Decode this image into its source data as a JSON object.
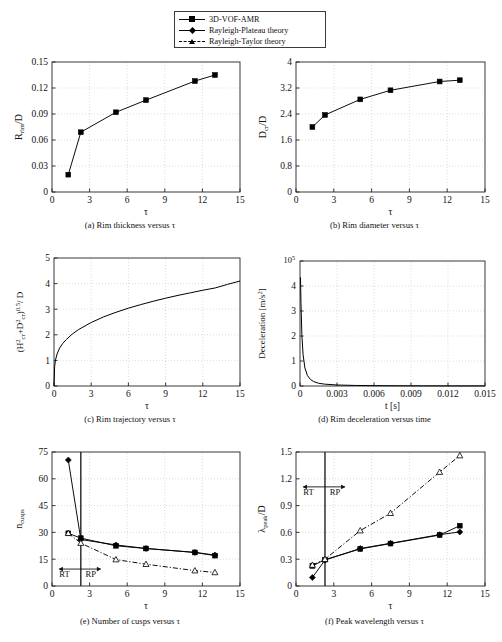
{
  "legend": {
    "entries": [
      {
        "label": "3D-VOF-AMR",
        "marker": "square-marker",
        "line": "solid",
        "color": "#000000"
      },
      {
        "label": "Rayleigh-Plateau theory",
        "marker": "diamond-marker",
        "line": "solid",
        "color": "#000000"
      },
      {
        "label": "Rayleigh-Taylor theory",
        "marker": "triangle-marker",
        "line": "dash-dot",
        "color": "#000000"
      }
    ]
  },
  "captions": {
    "a": "(a) Rim thickness versus τ",
    "b": "(b) Rim diameter versus τ",
    "c": "(c) Rim trajectory versus τ",
    "d": "(d) Rim deceleration versus time",
    "e": "(e) Number of cusps versus τ",
    "f": "(f) Peak wavelength versus τ"
  },
  "chart_data": [
    {
      "id": "a",
      "type": "line",
      "title": "Rim thickness versus τ",
      "xlabel": "τ",
      "ylabel": "R_rim /D",
      "xlim": [
        0,
        15
      ],
      "ylim": [
        0,
        0.15
      ],
      "xticks": [
        0,
        3,
        6,
        9,
        12,
        15
      ],
      "yticks": [
        0,
        0.03,
        0.06,
        0.09,
        0.12,
        0.15
      ],
      "xticklabels": [
        "0",
        "3",
        "6",
        "9",
        "12",
        "15"
      ],
      "yticklabels": [
        "0",
        "0.03",
        "0.06",
        "0.09",
        "0.12",
        "0.15"
      ],
      "grid": true,
      "legend_position": "external-top",
      "series": [
        {
          "name": "3D-VOF-AMR",
          "marker": "square",
          "line": "solid",
          "x": [
            1.3,
            2.3,
            5.1,
            7.5,
            11.4,
            13.0
          ],
          "values": [
            0.02,
            0.069,
            0.092,
            0.106,
            0.128,
            0.135
          ]
        }
      ]
    },
    {
      "id": "b",
      "type": "line",
      "title": "Rim diameter versus τ",
      "xlabel": "τ",
      "ylabel": "D_cr /D",
      "xlim": [
        0,
        15
      ],
      "ylim": [
        0,
        4
      ],
      "xticks": [
        0,
        3,
        6,
        9,
        12,
        15
      ],
      "yticks": [
        0,
        0.8,
        1.6,
        2.4,
        3.2,
        4
      ],
      "xticklabels": [
        "0",
        "3",
        "6",
        "9",
        "12",
        "15"
      ],
      "yticklabels": [
        "0",
        "0.8",
        "1.6",
        "2.4",
        "3.2",
        "4"
      ],
      "grid": true,
      "series": [
        {
          "name": "3D-VOF-AMR",
          "marker": "square",
          "line": "solid",
          "x": [
            1.3,
            2.3,
            5.1,
            7.5,
            11.4,
            13.0
          ],
          "values": [
            2.0,
            2.37,
            2.85,
            3.13,
            3.4,
            3.44
          ]
        }
      ]
    },
    {
      "id": "c",
      "type": "line",
      "title": "Rim trajectory versus τ",
      "xlabel": "τ",
      "ylabel": "(H²_cr+D²_cr)^0.5 / D",
      "xlim": [
        0,
        15
      ],
      "ylim": [
        0,
        5
      ],
      "xticks": [
        0,
        3,
        6,
        9,
        12,
        15
      ],
      "yticks": [
        0,
        1,
        2,
        3,
        4,
        5
      ],
      "xticklabels": [
        "0",
        "3",
        "6",
        "9",
        "12",
        "15"
      ],
      "yticklabels": [
        "0",
        "1",
        "2",
        "3",
        "4",
        "5"
      ],
      "grid": true,
      "series": [
        {
          "name": "rim-trajectory-curve",
          "marker": "none",
          "line": "solid",
          "x": [
            0.0,
            0.05,
            0.12,
            0.25,
            0.45,
            0.7,
            1.0,
            1.5,
            2.0,
            3.0,
            4.0,
            5.0,
            6.0,
            7.0,
            8.0,
            9.0,
            10.0,
            11.0,
            12.0,
            13.0,
            14.0,
            15.0
          ],
          "values": [
            0.0,
            0.75,
            1.02,
            1.25,
            1.48,
            1.66,
            1.82,
            2.04,
            2.21,
            2.48,
            2.7,
            2.88,
            3.04,
            3.18,
            3.31,
            3.43,
            3.54,
            3.64,
            3.74,
            3.83,
            3.97,
            4.1
          ]
        }
      ]
    },
    {
      "id": "d",
      "type": "line",
      "title": "Rim deceleration versus time",
      "xlabel": "t [s]",
      "ylabel": "Deceleration [m/s²]",
      "y_exponent": "10⁵",
      "xlim": [
        0,
        0.015
      ],
      "ylim": [
        0,
        5
      ],
      "xticks": [
        0,
        0.003,
        0.006,
        0.009,
        0.012,
        0.015
      ],
      "yticks": [
        0,
        1,
        2,
        3,
        4,
        5
      ],
      "xticklabels": [
        "0",
        "0.003",
        "0.006",
        "0.009",
        "0.012",
        "0.015"
      ],
      "yticklabels": [
        "0",
        "1",
        "2",
        "3",
        "4",
        ""
      ],
      "grid": true,
      "series": [
        {
          "name": "deceleration-curve",
          "marker": "none",
          "line": "solid",
          "x": [
            4e-05,
            8e-05,
            0.00015,
            0.00025,
            0.0004,
            0.0006,
            0.00085,
            0.0011,
            0.0015,
            0.002,
            0.003,
            0.0045,
            0.006,
            0.008,
            0.01,
            0.0125,
            0.015
          ],
          "values": [
            4.35,
            3.3,
            2.05,
            1.25,
            0.72,
            0.42,
            0.26,
            0.18,
            0.11,
            0.075,
            0.04,
            0.022,
            0.014,
            0.009,
            0.006,
            0.004,
            0.003
          ]
        }
      ]
    },
    {
      "id": "e",
      "type": "line",
      "title": "Number of cusps versus τ",
      "xlabel": "τ",
      "ylabel": "n_cusps",
      "xlim": [
        0,
        15
      ],
      "ylim": [
        0,
        75
      ],
      "xticks": [
        0,
        3,
        6,
        9,
        12,
        15
      ],
      "yticks": [
        0,
        15,
        30,
        45,
        60,
        75
      ],
      "xticklabels": [
        "0",
        "3",
        "6",
        "9",
        "12",
        "15"
      ],
      "yticklabels": [
        "0",
        "15",
        "30",
        "45",
        "60",
        "75"
      ],
      "grid": true,
      "regime_divider_x": 2.3,
      "annotations": [
        {
          "text": "RT",
          "x": 1.0,
          "y": 5.0
        },
        {
          "text": "RP",
          "x": 3.1,
          "y": 5.0
        }
      ],
      "series": [
        {
          "name": "3D-VOF-AMR",
          "marker": "square",
          "line": "solid",
          "x": [
            1.3,
            2.3,
            5.1,
            7.5,
            11.4,
            13.0
          ],
          "values": [
            29.5,
            26.8,
            22.5,
            21.0,
            18.8,
            17.0
          ]
        },
        {
          "name": "Rayleigh-Plateau theory",
          "marker": "diamond",
          "line": "solid",
          "x": [
            1.3,
            2.3,
            5.1,
            7.5,
            11.4,
            13.0
          ],
          "values": [
            70.5,
            26.0,
            23.0,
            21.0,
            18.8,
            17.3
          ]
        },
        {
          "name": "Rayleigh-Taylor theory",
          "marker": "triangle",
          "line": "dash-dot",
          "x": [
            1.3,
            2.3,
            5.1,
            7.5,
            11.4,
            13.0
          ],
          "values": [
            29.5,
            24.0,
            14.8,
            12.2,
            8.6,
            7.6
          ]
        }
      ]
    },
    {
      "id": "f",
      "type": "line",
      "title": "Peak wavelength versus τ",
      "xlabel": "τ",
      "ylabel": "λ_peak /D",
      "xlim": [
        0,
        15
      ],
      "ylim": [
        0,
        1.5
      ],
      "xticks": [
        0,
        3,
        6,
        9,
        12,
        15
      ],
      "yticks": [
        0,
        0.3,
        0.6,
        0.9,
        1.2,
        1.5
      ],
      "xticklabels": [
        "0",
        "3",
        "6",
        "9",
        "12",
        "15"
      ],
      "yticklabels": [
        "0",
        "0.3",
        "0.6",
        "0.9",
        "1.2",
        "1.5"
      ],
      "grid": true,
      "regime_divider_x": 2.3,
      "annotations": [
        {
          "text": "RT",
          "x": 1.0,
          "y": 1.02
        },
        {
          "text": "RP",
          "x": 3.1,
          "y": 1.02
        }
      ],
      "series": [
        {
          "name": "3D-VOF-AMR",
          "marker": "square",
          "line": "solid",
          "x": [
            1.3,
            2.3,
            5.1,
            7.5,
            11.4,
            13.0
          ],
          "values": [
            0.225,
            0.295,
            0.415,
            0.475,
            0.57,
            0.675
          ]
        },
        {
          "name": "Rayleigh-Plateau theory",
          "marker": "diamond",
          "line": "solid",
          "x": [
            1.3,
            2.3,
            5.1,
            7.5,
            11.4,
            13.0
          ],
          "values": [
            0.095,
            0.29,
            0.42,
            0.478,
            0.575,
            0.605
          ]
        },
        {
          "name": "Rayleigh-Taylor theory",
          "marker": "triangle",
          "line": "dash-dot",
          "x": [
            1.3,
            2.3,
            5.1,
            7.5,
            11.4,
            13.0
          ],
          "values": [
            0.235,
            0.3,
            0.62,
            0.815,
            1.275,
            1.46
          ]
        }
      ]
    }
  ]
}
